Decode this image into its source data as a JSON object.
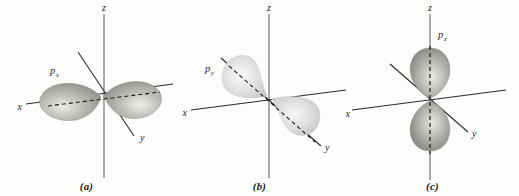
{
  "figure": {
    "background_color": "#fdfdfc",
    "axis_color": "#2b2b2b",
    "label_color": "#1c1c1c"
  },
  "panels": [
    {
      "caption": "(a)",
      "orbital_base": "p",
      "orbital_subscript": "x",
      "orbital_label": "px",
      "axes": {
        "x_label": "x",
        "y_label": "y",
        "z_label": "z"
      },
      "lobe_color_light": "#e8e8e6",
      "lobe_color_mid": "#b3b3b0",
      "lobe_color_dark": "#8d8d8a",
      "lobe_orientation": "along-x-axis",
      "dashed_axis": "x"
    },
    {
      "caption": "(b)",
      "orbital_base": "p",
      "orbital_subscript": "y",
      "orbital_label": "py",
      "axes": {
        "x_label": "x",
        "y_label": "y",
        "z_label": "z"
      },
      "lobe_color_light": "#f2f2f1",
      "lobe_color_mid": "#dcdcda",
      "lobe_color_dark": "#c2c2bf",
      "lobe_orientation": "along-y-axis",
      "dashed_axis": "y"
    },
    {
      "caption": "(c)",
      "orbital_base": "p",
      "orbital_subscript": "z",
      "orbital_label": "pz",
      "axes": {
        "x_label": "x",
        "y_label": "y",
        "z_label": "z"
      },
      "lobe_color_light": "#e4e4e2",
      "lobe_color_mid": "#adadaa",
      "lobe_color_dark": "#828280",
      "lobe_orientation": "along-z-axis",
      "dashed_axis": "z"
    }
  ]
}
